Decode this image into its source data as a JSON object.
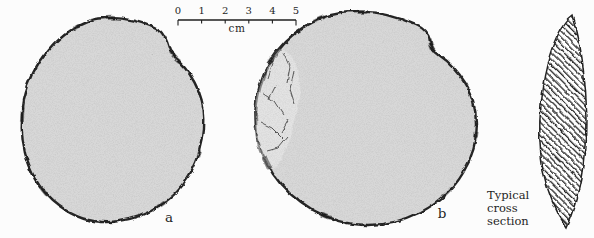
{
  "figure": {
    "colors": {
      "background": "#fcfcfc",
      "ink": "#1f1f1f",
      "stone_fill": "#d7d7d7",
      "flake_scar_fill": "#e2e2e2"
    },
    "discs": [
      {
        "label": "a"
      },
      {
        "label": "b"
      }
    ],
    "scale_bar": {
      "tick_labels": [
        "0",
        "1",
        "2",
        "3",
        "4",
        "5"
      ],
      "unit": "cm"
    },
    "cross_section": {
      "caption_lines": [
        "Typical",
        "cross",
        "section"
      ]
    }
  }
}
